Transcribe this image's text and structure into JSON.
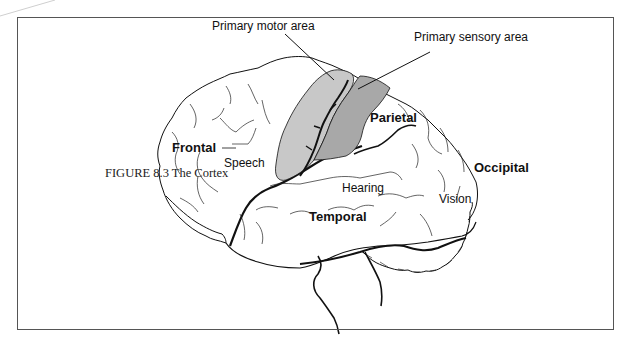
{
  "figure": {
    "caption": "FIGURE 8.3 The Cortex",
    "colors": {
      "motor_area_fill": "#c8c8c8",
      "sensory_area_fill": "#a8a8a8",
      "outline": "#111111",
      "frame": "#555555",
      "background": "#ffffff"
    },
    "callouts": {
      "primary_motor_area": "Primary motor area",
      "primary_sensory_area": "Primary sensory area"
    },
    "lobes": {
      "frontal": "Frontal",
      "parietal": "Parietal",
      "occipital": "Occipital",
      "temporal": "Temporal"
    },
    "functions": {
      "speech": "Speech",
      "hearing": "Hearing",
      "vision": "Vision"
    }
  }
}
